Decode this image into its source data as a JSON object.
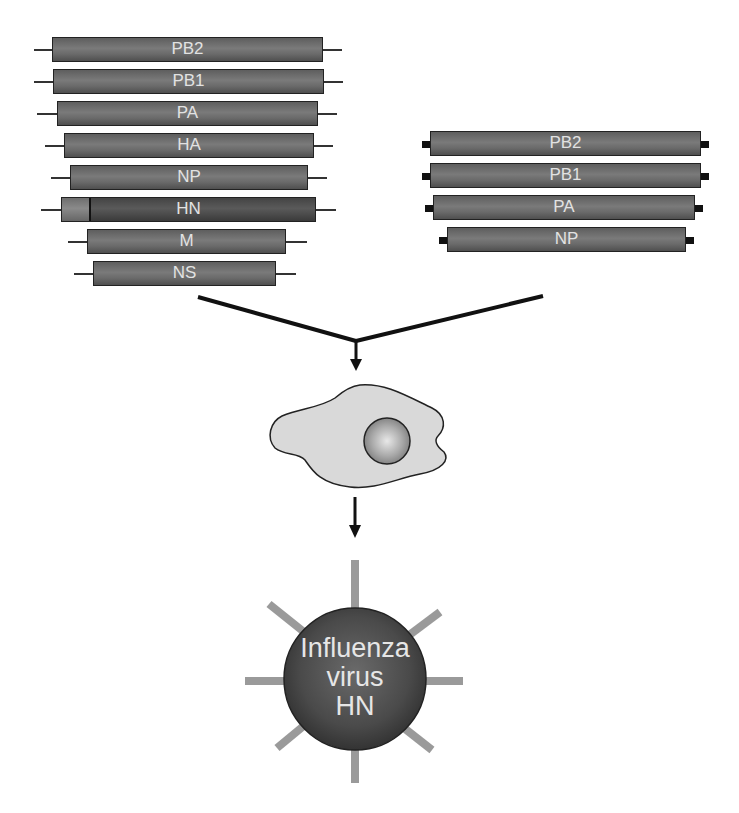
{
  "diagram": {
    "type": "influenza reverse-genetics schematic",
    "left_set": {
      "description": "8 plasmid segments with thin-line ends",
      "segments": [
        {
          "label": "PB2",
          "x": 52,
          "y": 37,
          "w": 271,
          "h": 25,
          "tail_l": 34,
          "tail_r": 342
        },
        {
          "label": "PB1",
          "x": 53,
          "y": 69,
          "w": 271,
          "h": 25,
          "tail_l": 34,
          "tail_r": 343
        },
        {
          "label": "PA",
          "x": 57,
          "y": 101,
          "w": 261,
          "h": 25,
          "tail_l": 37,
          "tail_r": 337
        },
        {
          "label": "HA",
          "x": 64,
          "y": 133,
          "w": 250,
          "h": 25,
          "tail_l": 45,
          "tail_r": 333
        },
        {
          "label": "NP",
          "x": 70,
          "y": 165,
          "w": 238,
          "h": 25,
          "tail_l": 51,
          "tail_r": 327
        },
        {
          "label": "HN",
          "x": 61,
          "y": 197,
          "w": 255,
          "h": 25,
          "tail_l": 41,
          "tail_r": 336,
          "chimeric": true,
          "light_part_w": 27
        },
        {
          "label": "M",
          "x": 87,
          "y": 229,
          "w": 199,
          "h": 25,
          "tail_l": 68,
          "tail_r": 307
        },
        {
          "label": "NS",
          "x": 93,
          "y": 261,
          "w": 183,
          "h": 25,
          "tail_l": 74,
          "tail_r": 296
        }
      ]
    },
    "right_set": {
      "description": "4 protein-expression plasmids with black end caps",
      "segments": [
        {
          "label": "PB2",
          "x": 430,
          "y": 131,
          "w": 271,
          "h": 25
        },
        {
          "label": "PB1",
          "x": 430,
          "y": 163,
          "w": 271,
          "h": 25
        },
        {
          "label": "PA",
          "x": 433,
          "y": 195,
          "w": 262,
          "h": 25
        },
        {
          "label": "NP",
          "x": 447,
          "y": 227,
          "w": 239,
          "h": 25
        }
      ]
    },
    "cell": {
      "label": "",
      "nucleus": true
    },
    "virus": {
      "lines": [
        "Influenza",
        "virus",
        "HN"
      ]
    },
    "colors": {
      "segment_fill": "#6e6e6e",
      "segment_dark": "#4a4a4a",
      "label_text": "#e2e2e2",
      "cell_fill": "#d9d9d9",
      "virus_fill": "#4a4a4a",
      "spike": "#9a9a9a",
      "arrow": "#111111"
    }
  }
}
